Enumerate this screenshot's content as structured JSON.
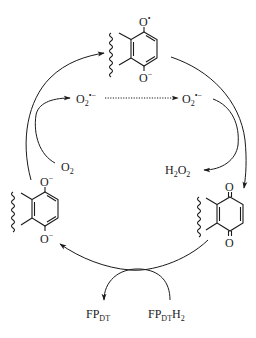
{
  "diagram": {
    "species": {
      "semiquinone": {
        "top_atom": "O",
        "top_mark": "•",
        "bottom_atom": "O",
        "bottom_mark": "−"
      },
      "hydroquinone_dianion": {
        "top_atom": "O",
        "top_mark": "−",
        "bottom_atom": "O",
        "bottom_mark": "−"
      },
      "quinone": {
        "top_atom": "O",
        "bottom_atom": "O"
      }
    },
    "labels": {
      "superoxide_left": {
        "base": "O",
        "sub": "2",
        "sup": "•−"
      },
      "superoxide_right": {
        "base": "O",
        "sub": "2",
        "sup": "•−"
      },
      "oxygen": {
        "base": "O",
        "sub": "2"
      },
      "hydrogen_peroxide": {
        "h": "H",
        "h_sub": "2",
        "o": "O",
        "o_sub": "2"
      },
      "fp_oxidized": {
        "base": "FP",
        "sub": "DT"
      },
      "fp_reduced": {
        "base": "FP",
        "sub": "DT",
        "h": "H",
        "h_sub": "2"
      }
    },
    "arrows": [
      {
        "from": "hydroquinone_dianion",
        "to": "semiquinone",
        "style": "solid"
      },
      {
        "from": "semiquinone",
        "to": "quinone",
        "style": "solid"
      },
      {
        "from": "quinone",
        "to": "hydroquinone_dianion",
        "style": "solid"
      },
      {
        "from": "oxygen",
        "to": "superoxide_left",
        "style": "solid"
      },
      {
        "from": "superoxide_left",
        "to": "superoxide_right",
        "style": "dotted"
      },
      {
        "from": "superoxide_right",
        "to": "hydrogen_peroxide",
        "style": "solid"
      },
      {
        "from": "fp_reduced",
        "to": "fp_oxidized",
        "style": "solid"
      }
    ],
    "colors": {
      "ink": "#1a1a1a",
      "background": "#ffffff"
    }
  }
}
